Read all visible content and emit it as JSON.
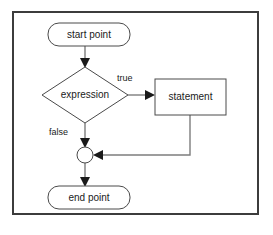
{
  "diagram": {
    "type": "flowchart",
    "frame": {
      "x": 13,
      "y": 12,
      "width": 245,
      "height": 202,
      "border_color": "#3c3c3c"
    },
    "colors": {
      "shape_stroke": "#4a4a4a",
      "shape_fill": "#ffffff",
      "edge_line": "#7d7d7d",
      "arrow_head": "#1a1a1a",
      "text": "#1a1a1a",
      "background": "#ffffff"
    },
    "nodes": [
      {
        "id": "start",
        "shape": "rounded-rect",
        "label": "start point",
        "x": 48,
        "y": 23,
        "width": 82,
        "height": 23,
        "rx": 11
      },
      {
        "id": "expression",
        "shape": "diamond",
        "label": "expression",
        "cx": 85,
        "cy": 95,
        "half_width": 43,
        "half_height": 28
      },
      {
        "id": "statement",
        "shape": "rect",
        "label": "statement",
        "x": 155,
        "y": 79,
        "width": 71,
        "height": 36
      },
      {
        "id": "merge",
        "shape": "circle",
        "label": "",
        "cx": 85,
        "cy": 155,
        "r": 8
      },
      {
        "id": "end",
        "shape": "rounded-rect",
        "label": "end point",
        "x": 48,
        "y": 186,
        "width": 82,
        "height": 23,
        "rx": 11
      }
    ],
    "edges": [
      {
        "id": "start-to-expression",
        "from": "start",
        "to": "expression",
        "label": "",
        "path": "M 85 46 L 85 63"
      },
      {
        "id": "expression-to-statement",
        "from": "expression",
        "to": "statement",
        "label": "true",
        "path": "M 128 95 L 151 95"
      },
      {
        "id": "expression-to-merge",
        "from": "expression",
        "to": "merge",
        "label": "false",
        "path": "M 85 123 L 85 143"
      },
      {
        "id": "statement-to-merge",
        "from": "statement",
        "to": "merge",
        "label": "",
        "path": "M 190 115 L 190 155 L 97 155"
      },
      {
        "id": "merge-to-end",
        "from": "merge",
        "to": "end",
        "label": "",
        "path": "M 85 163 L 85 182"
      }
    ],
    "edge_labels": [
      {
        "id": "label-true",
        "text": "true",
        "x": 117,
        "y": 79
      },
      {
        "id": "label-false",
        "text": "false",
        "x": 49,
        "y": 133
      }
    ]
  }
}
